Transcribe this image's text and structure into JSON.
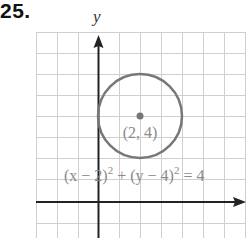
{
  "problem": {
    "number": "25."
  },
  "graph": {
    "y_axis_label": "y",
    "point_label": "(2, 4)",
    "equation": {
      "lhs1": "(x − 2)",
      "exp1": "2",
      "plus": " + (y − 4)",
      "exp2": "2",
      "rhs": " = 4"
    },
    "colors": {
      "grid": "#cfcfcf",
      "axis": "#222222",
      "circle": "#777777",
      "point": "#777777",
      "text": "#8a8a8a"
    },
    "center": {
      "x": 2,
      "y": 4
    },
    "radius": 2
  }
}
